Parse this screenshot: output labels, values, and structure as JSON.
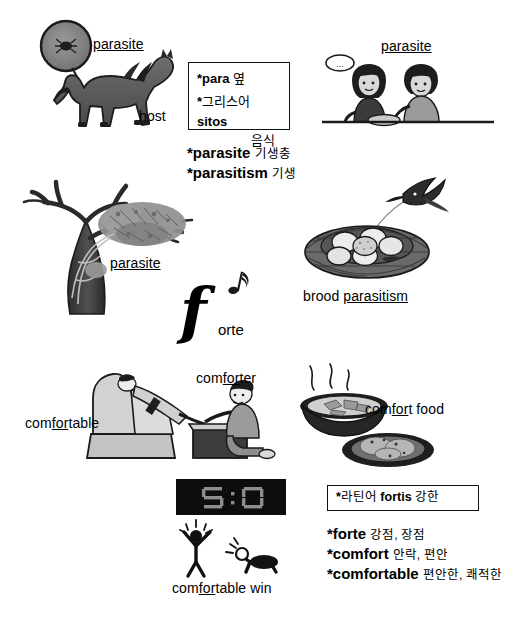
{
  "page": {
    "language": "ko-en",
    "background": "#ffffff",
    "ink": "#111111"
  },
  "sections": {
    "horse": {
      "parasite_label": "parasite",
      "parasite_label_parts": [
        "para",
        "sit",
        "e"
      ],
      "host_label": "host",
      "caption_note": "tick magnified on horse"
    },
    "roots_box": {
      "line1_star": "*",
      "line1_word": "para",
      "line1_ko": "옆",
      "line2_star": "*",
      "line2_lang": "그리스어",
      "line2_word": "sitos",
      "line2_ko": "음식"
    },
    "roots_defs": [
      {
        "star": "*",
        "en": "parasite",
        "ko": "기생충"
      },
      {
        "star": "*",
        "en": "parasitism",
        "ko": "기생"
      }
    ],
    "dinner": {
      "parasite_label": "parasite",
      "speech_dots": "..."
    },
    "tree": {
      "parasite_label": "parasite"
    },
    "nest": {
      "label_plain": "brood ",
      "label_word": "parasitism"
    },
    "forte": {
      "glyph": "𝆑",
      "glyph_fallback": "f",
      "rest": "orte",
      "notes": "♪"
    },
    "recliner": {
      "comfortable_label": "comfortable",
      "comforter_label": "comforter"
    },
    "food": {
      "label": "comfort food"
    },
    "scoreboard": {
      "home_score": "5",
      "separator": ":",
      "away_score": "0",
      "caption": "comfortable win",
      "panel_color": "#0d0d0d",
      "digit_color": "#8d8d8d"
    },
    "fortis_box": {
      "star": "*",
      "lang": "라틴어",
      "word": "fortis",
      "ko": "강한"
    },
    "fortis_defs": [
      {
        "star": "*",
        "en": "forte",
        "ko": "강점, 장점"
      },
      {
        "star": "*",
        "en": "comfort",
        "ko": "안락, 편안"
      },
      {
        "star": "*",
        "en": "comfortable",
        "ko": "편안한, 쾌적한"
      }
    ]
  }
}
